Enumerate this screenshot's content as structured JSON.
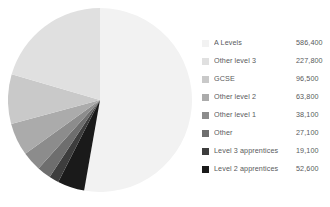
{
  "chart_data": {
    "type": "pie",
    "title": "",
    "subtitle": "",
    "xlabel": "",
    "ylabel": "",
    "legend_position": "right",
    "grid": false,
    "start_angle_deg": 0,
    "direction": "clockwise",
    "categories": [
      "A Levels",
      "Other level 3",
      "GCSE",
      "Other level 2",
      "Other level 1",
      "Other",
      "Level 3 apprentices",
      "Level 2 apprentices"
    ],
    "values": [
      586400,
      227800,
      96500,
      63800,
      38100,
      27100,
      19100,
      52600
    ],
    "value_labels": [
      "586,400",
      "227,800",
      "96,500",
      "63,800",
      "38,100",
      "27,100",
      "19,100",
      "52,600"
    ],
    "colors": [
      "#f2f2f2",
      "#e0e0e0",
      "#c9c9c9",
      "#ababab",
      "#8c8c8c",
      "#6e6e6e",
      "#3d3d3d",
      "#1a1a1a"
    ],
    "slice_order": [
      "A Levels",
      "Level 2 apprentices",
      "Level 3 apprentices",
      "Other",
      "Other level 1",
      "Other level 2",
      "GCSE",
      "Other level 3"
    ]
  },
  "legend": {
    "rows": [
      {
        "label": "A Levels",
        "value": "586,400",
        "color": "#f2f2f2"
      },
      {
        "label": "Other level 3",
        "value": "227,800",
        "color": "#e0e0e0"
      },
      {
        "label": "GCSE",
        "value": "96,500",
        "color": "#c9c9c9"
      },
      {
        "label": "Other level 2",
        "value": "63,800",
        "color": "#ababab"
      },
      {
        "label": "Other level 1",
        "value": "38,100",
        "color": "#8c8c8c"
      },
      {
        "label": "Other",
        "value": "27,100",
        "color": "#6e6e6e"
      },
      {
        "label": "Level 3 apprentices",
        "value": "19,100",
        "color": "#3d3d3d"
      },
      {
        "label": "Level 2 apprentices",
        "value": "52,600",
        "color": "#1a1a1a"
      }
    ]
  }
}
